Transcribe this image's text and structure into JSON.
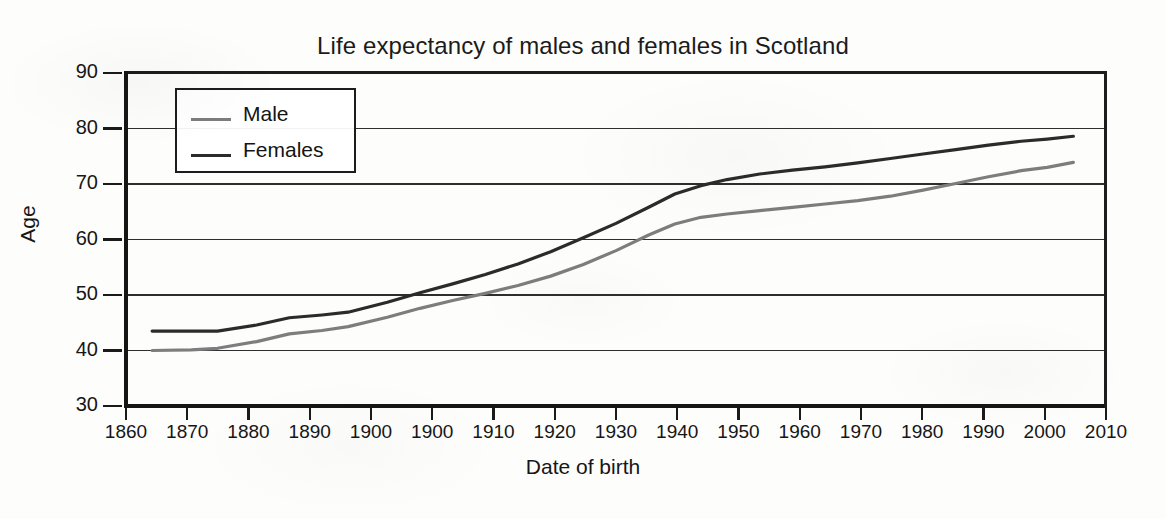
{
  "chart_data": {
    "type": "line",
    "title": "Life expectancy of males and females in Scotland",
    "xlabel": "Date of birth",
    "ylabel": "Age",
    "xlim": [
      1860,
      2010
    ],
    "ylim": [
      30,
      90
    ],
    "grid": "horizontal",
    "legend_position": "top-left-inside",
    "x_tick_labels": [
      "1860",
      "1870",
      "1880",
      "1890",
      "1900",
      "1900",
      "1910",
      "1920",
      "1930",
      "1940",
      "1950",
      "1960",
      "1970",
      "1980",
      "1990",
      "2000",
      "2010"
    ],
    "y_tick_labels": [
      "30",
      "40",
      "50",
      "60",
      "70",
      "80",
      "90"
    ],
    "y_ticks": [
      30,
      40,
      50,
      60,
      70,
      80,
      90
    ],
    "note": "The x-axis tick labels contain a duplicated '1900' as printed in the original figure; tick marks are evenly spaced every 10 years from 1860 to 2010.",
    "series": [
      {
        "name": "Male",
        "color": "#7d7d7d",
        "x": [
          1864,
          1870,
          1874,
          1880,
          1885,
          1890,
          1894,
          1900,
          1905,
          1910,
          1915,
          1920,
          1925,
          1930,
          1935,
          1940,
          1944,
          1948,
          1952,
          1957,
          1962,
          1967,
          1972,
          1977,
          1982,
          1987,
          1992,
          1997,
          2001,
          2005
        ],
        "y": [
          40.0,
          40.1,
          40.4,
          41.6,
          43.0,
          43.6,
          44.3,
          46.0,
          47.6,
          49.0,
          50.3,
          51.7,
          53.4,
          55.5,
          58.0,
          60.8,
          62.8,
          64.0,
          64.6,
          65.2,
          65.8,
          66.4,
          67.0,
          67.8,
          68.9,
          70.1,
          71.3,
          72.4,
          73.0,
          73.9
        ]
      },
      {
        "name": "Females",
        "color": "#2b2b2b",
        "x": [
          1864,
          1870,
          1874,
          1880,
          1885,
          1890,
          1894,
          1900,
          1905,
          1910,
          1915,
          1920,
          1925,
          1930,
          1935,
          1940,
          1944,
          1948,
          1952,
          1957,
          1962,
          1967,
          1972,
          1977,
          1982,
          1987,
          1992,
          1997,
          2001,
          2005
        ],
        "y": [
          43.5,
          43.5,
          43.5,
          44.6,
          45.9,
          46.4,
          46.9,
          48.7,
          50.4,
          52.0,
          53.7,
          55.6,
          57.8,
          60.3,
          62.9,
          65.8,
          68.2,
          69.7,
          70.8,
          71.8,
          72.5,
          73.1,
          73.8,
          74.6,
          75.4,
          76.2,
          77.0,
          77.7,
          78.1,
          78.6
        ]
      }
    ]
  },
  "legend": {
    "items": [
      {
        "label": "Male",
        "color": "#7d7d7d"
      },
      {
        "label": "Females",
        "color": "#2b2b2b"
      }
    ]
  }
}
